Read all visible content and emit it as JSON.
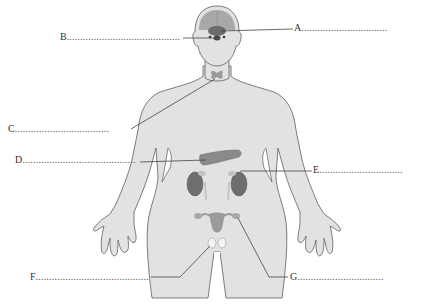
{
  "diagram": {
    "colors": {
      "body_fill": "#e2e2e2",
      "body_outline": "#6e6e6e",
      "gland_dark": "#6a6a6a",
      "gland_mid": "#9a9a9a",
      "gland_light": "#c4c4c4",
      "leader_line": "#444444"
    },
    "labels": [
      {
        "id": "A",
        "letter": "A",
        "dots": "................................",
        "target": "pituitary/hypothalamus region of brain"
      },
      {
        "id": "B",
        "letter": "B",
        "dots": "..........................................",
        "target": "pineal/pituitary gland"
      },
      {
        "id": "C",
        "letter": "C",
        "dots": "...................................",
        "target": "thyroid gland"
      },
      {
        "id": "D",
        "letter": "D",
        "dots": "..........................................",
        "target": "pancreas"
      },
      {
        "id": "E",
        "letter": "E",
        "dots": "...............................",
        "target": "adrenal gland"
      },
      {
        "id": "F",
        "letter": "F",
        "dots": "..........................................",
        "target": "testes"
      },
      {
        "id": "G",
        "letter": "G",
        "dots": "................................",
        "target": "ovary"
      }
    ]
  }
}
